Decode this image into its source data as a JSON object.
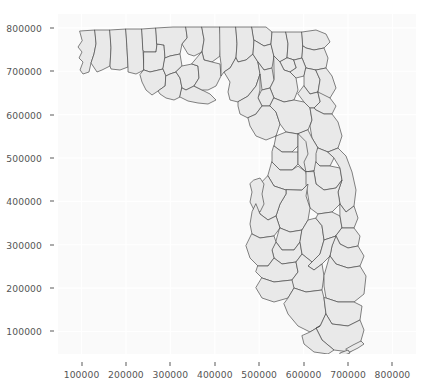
{
  "chart_data": {
    "type": "map",
    "title": "",
    "subtitle": "",
    "xlabel": "",
    "ylabel": "",
    "xlim": [
      47000,
      853000
    ],
    "ylim": [
      48000,
      832000
    ],
    "grid": true,
    "legend": null,
    "projection_units": "meters",
    "region": "Florida counties",
    "geometry_fill": "#e9e9e9",
    "geometry_stroke": "#4d4d4d",
    "panel_background": "#fafafa",
    "gridline_color": "#ffffff",
    "xticks": [
      100000,
      200000,
      300000,
      400000,
      500000,
      600000,
      700000,
      800000
    ],
    "yticks": [
      100000,
      200000,
      300000,
      400000,
      500000,
      600000,
      700000,
      800000
    ],
    "xtick_labels": [
      "100000",
      "200000",
      "300000",
      "400000",
      "500000",
      "600000",
      "700000",
      "800000"
    ],
    "ytick_labels": [
      "100000",
      "200000",
      "300000",
      "400000",
      "500000",
      "600000",
      "700000",
      "800000"
    ],
    "feature_count": 67,
    "series": [
      {
        "name": "county_boundaries",
        "values": []
      }
    ]
  },
  "axis": {
    "y": {
      "ticks": [
        {
          "value": 800000,
          "label": "800000"
        },
        {
          "value": 700000,
          "label": "700000"
        },
        {
          "value": 600000,
          "label": "600000"
        },
        {
          "value": 500000,
          "label": "500000"
        },
        {
          "value": 400000,
          "label": "400000"
        },
        {
          "value": 300000,
          "label": "300000"
        },
        {
          "value": 200000,
          "label": "200000"
        },
        {
          "value": 100000,
          "label": "100000"
        }
      ]
    },
    "x": {
      "ticks": [
        {
          "value": 100000,
          "label": "100000"
        },
        {
          "value": 200000,
          "label": "200000"
        },
        {
          "value": 300000,
          "label": "300000"
        },
        {
          "value": 400000,
          "label": "400000"
        },
        {
          "value": 500000,
          "label": "500000"
        },
        {
          "value": 600000,
          "label": "600000"
        },
        {
          "value": 700000,
          "label": "700000"
        },
        {
          "value": 800000,
          "label": "800000"
        }
      ]
    }
  }
}
